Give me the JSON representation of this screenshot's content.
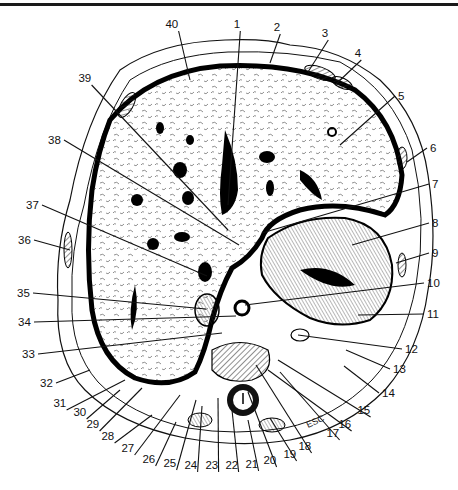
{
  "figure": {
    "type": "anatomical cross-section (transverse section of upper abdomen)",
    "top_rule": true,
    "annotation_text": "ESC"
  },
  "labels": [
    {
      "n": "1",
      "x": 237,
      "y": 28,
      "tx": 228,
      "ty": 205
    },
    {
      "n": "2",
      "x": 277,
      "y": 31,
      "tx": 270,
      "ty": 63
    },
    {
      "n": "3",
      "x": 325,
      "y": 37,
      "tx": 308,
      "ty": 72
    },
    {
      "n": "4",
      "x": 358,
      "y": 57,
      "tx": 335,
      "ty": 85
    },
    {
      "n": "5",
      "x": 398,
      "y": 100,
      "tx": 340,
      "ty": 145
    },
    {
      "n": "6",
      "x": 430,
      "y": 152,
      "tx": 407,
      "ty": 162
    },
    {
      "n": "7",
      "x": 432,
      "y": 188,
      "tx": 262,
      "ty": 233
    },
    {
      "n": "8",
      "x": 432,
      "y": 227,
      "tx": 352,
      "ty": 245
    },
    {
      "n": "9",
      "x": 432,
      "y": 257,
      "tx": 396,
      "ty": 263
    },
    {
      "n": "10",
      "x": 427,
      "y": 287,
      "tx": 245,
      "ty": 305
    },
    {
      "n": "11",
      "x": 427,
      "y": 318,
      "tx": 358,
      "ty": 315
    },
    {
      "n": "12",
      "x": 405,
      "y": 353,
      "tx": 298,
      "ty": 335
    },
    {
      "n": "13",
      "x": 393,
      "y": 373,
      "tx": 346,
      "ty": 350
    },
    {
      "n": "14",
      "x": 382,
      "y": 397,
      "tx": 344,
      "ty": 366
    },
    {
      "n": "15",
      "x": 364,
      "y": 414,
      "tx": 278,
      "ty": 360
    },
    {
      "n": "16",
      "x": 345,
      "y": 428,
      "tx": 268,
      "ty": 370
    },
    {
      "n": "17",
      "x": 333,
      "y": 437,
      "tx": 280,
      "ty": 372
    },
    {
      "n": "18",
      "x": 305,
      "y": 450,
      "tx": 256,
      "ty": 365
    },
    {
      "n": "19",
      "x": 290,
      "y": 458,
      "tx": 270,
      "ty": 418
    },
    {
      "n": "20",
      "x": 270,
      "y": 464,
      "tx": 248,
      "ty": 392
    },
    {
      "n": "21",
      "x": 252,
      "y": 468,
      "tx": 248,
      "ty": 420
    },
    {
      "n": "22",
      "x": 232,
      "y": 469,
      "tx": 232,
      "ty": 410
    },
    {
      "n": "23",
      "x": 212,
      "y": 469,
      "tx": 218,
      "ty": 398
    },
    {
      "n": "24",
      "x": 191,
      "y": 469,
      "tx": 202,
      "ty": 406
    },
    {
      "n": "25",
      "x": 170,
      "y": 467,
      "tx": 196,
      "ty": 400
    },
    {
      "n": "26",
      "x": 149,
      "y": 463,
      "tx": 176,
      "ty": 422
    },
    {
      "n": "27",
      "x": 128,
      "y": 452,
      "tx": 180,
      "ty": 395
    },
    {
      "n": "28",
      "x": 108,
      "y": 440,
      "tx": 152,
      "ty": 415
    },
    {
      "n": "29",
      "x": 93,
      "y": 428,
      "tx": 142,
      "ty": 388
    },
    {
      "n": "30",
      "x": 80,
      "y": 416,
      "tx": 120,
      "ty": 390
    },
    {
      "n": "31",
      "x": 60,
      "y": 407,
      "tx": 125,
      "ty": 380
    },
    {
      "n": "32",
      "x": 40,
      "y": 387,
      "tx": 90,
      "ty": 370
    },
    {
      "n": "33",
      "x": 22,
      "y": 358,
      "tx": 222,
      "ty": 333
    },
    {
      "n": "34",
      "x": 18,
      "y": 326,
      "tx": 236,
      "ty": 316
    },
    {
      "n": "35",
      "x": 17,
      "y": 297,
      "tx": 206,
      "ty": 309
    },
    {
      "n": "36",
      "x": 18,
      "y": 244,
      "tx": 70,
      "ty": 250
    },
    {
      "n": "37",
      "x": 26,
      "y": 209,
      "tx": 207,
      "ty": 276
    },
    {
      "n": "38",
      "x": 48,
      "y": 144,
      "tx": 239,
      "ty": 245
    },
    {
      "n": "39",
      "x": 85,
      "y": 82,
      "tx": 228,
      "ty": 230
    },
    {
      "n": "40",
      "x": 172,
      "y": 28,
      "tx": 190,
      "ty": 80
    }
  ],
  "esc": {
    "text": "ESC",
    "x": 308,
    "y": 428
  }
}
